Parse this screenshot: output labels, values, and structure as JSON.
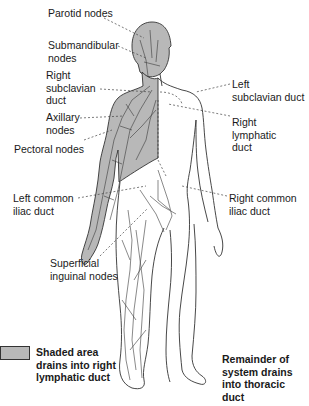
{
  "diagram": {
    "colors": {
      "shaded": "#b8b8b8",
      "outline": "#333333",
      "vessels": "#3a3a3a",
      "leader": "#444444",
      "background": "#ffffff"
    },
    "labels": {
      "parotid": "Parotid nodes",
      "submandibular": "Submandibular\nnodes",
      "right_subclavian": "Right\nsubclavian\nduct",
      "axillary": "Axillary\nnodes",
      "pectoral": "Pectoral nodes",
      "left_common_iliac": "Left common\niliac duct",
      "superficial_inguinal": "Superficial\ninguinal nodes",
      "left_subclavian": "Left\nsubclavian duct",
      "right_lymphatic": "Right\nlymphatic\nduct",
      "right_common_iliac": "Right common\niliac duct"
    },
    "legend": {
      "shaded_text": "Shaded area\ndrains into right\nlymphatic duct",
      "remainder_text": "Remainder of\nsystem drains\ninto thoracic\nduct"
    }
  }
}
